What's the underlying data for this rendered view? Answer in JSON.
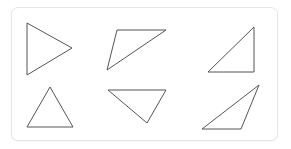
{
  "figure": {
    "stroke_color": "#555555",
    "card_border_color": "#e6e6e6",
    "triangles": [
      {
        "id": "triangle-1",
        "kind": "isosceles-pointing-right",
        "points": "27,23 72,48 27,75"
      },
      {
        "id": "triangle-2",
        "kind": "obtuse-scalene",
        "points": "117,30 166,30 107,70"
      },
      {
        "id": "triangle-3",
        "kind": "right-triangle",
        "points": "254,27 254,72 208,72"
      },
      {
        "id": "triangle-4",
        "kind": "isosceles-pointing-up",
        "points": "50,87 73,127 27,127"
      },
      {
        "id": "triangle-5",
        "kind": "scalene-pointing-down",
        "points": "108,90 166,90 147,123"
      },
      {
        "id": "triangle-6",
        "kind": "obtuse-scalene",
        "points": "259,85 241,129 202,129"
      }
    ]
  }
}
